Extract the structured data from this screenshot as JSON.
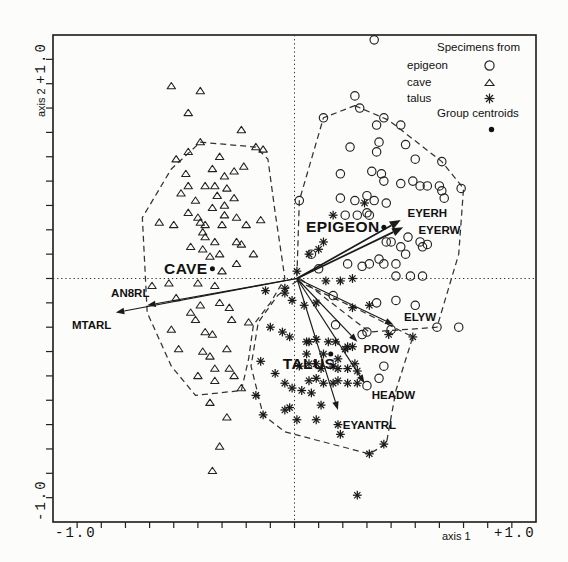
{
  "figure": {
    "width": 568,
    "height": 562
  },
  "axes": {
    "x_name": "axis 1",
    "x_min": "-1.0",
    "x_max": "+1.0",
    "y_name": "axis 2",
    "y_max": "+1.0",
    "y_min": "-1.0"
  },
  "legend": {
    "title": "Specimens from",
    "items": [
      {
        "label": "epigeon",
        "marker": "circle"
      },
      {
        "label": "cave",
        "marker": "triangle"
      },
      {
        "label": "talus",
        "marker": "asterisk"
      }
    ],
    "centroid_title": "Group centroids",
    "centroid_marker": "filled-dot"
  },
  "colors": {
    "ink": "#1a1a1a",
    "paper": "#fcfcfa",
    "hull": "#333333"
  },
  "chart_data": {
    "type": "scatter",
    "title": "",
    "xlabel": "axis 1",
    "ylabel": "axis 2",
    "xlim": [
      -1,
      1
    ],
    "ylim": [
      -1,
      1
    ],
    "grid": false,
    "legend_position": "top-right",
    "arrow_origin": [
      0.01,
      0.0
    ],
    "series": [
      {
        "name": "epigeon",
        "marker": "circle",
        "points": [
          [
            0.33,
            0.98
          ],
          [
            0.25,
            0.75
          ],
          [
            0.27,
            0.7
          ],
          [
            0.12,
            0.66
          ],
          [
            0.37,
            0.66
          ],
          [
            0.34,
            0.63
          ],
          [
            0.44,
            0.63
          ],
          [
            0.23,
            0.54
          ],
          [
            0.35,
            0.56
          ],
          [
            0.34,
            0.52
          ],
          [
            0.46,
            0.55
          ],
          [
            0.5,
            0.49
          ],
          [
            0.61,
            0.48
          ],
          [
            0.19,
            0.43
          ],
          [
            0.32,
            0.44
          ],
          [
            0.36,
            0.43
          ],
          [
            0.37,
            0.4
          ],
          [
            0.44,
            0.39
          ],
          [
            0.49,
            0.4
          ],
          [
            0.52,
            0.38
          ],
          [
            0.55,
            0.38
          ],
          [
            0.6,
            0.38
          ],
          [
            0.61,
            0.36
          ],
          [
            0.69,
            0.37
          ],
          [
            0.02,
            0.32
          ],
          [
            0.19,
            0.33
          ],
          [
            0.25,
            0.32
          ],
          [
            0.3,
            0.34
          ],
          [
            0.33,
            0.32
          ],
          [
            0.38,
            0.31
          ],
          [
            0.62,
            0.33
          ],
          [
            0.3,
            0.27
          ],
          [
            0.26,
            0.26
          ],
          [
            0.21,
            0.26
          ],
          [
            0.31,
            0.26
          ],
          [
            0.38,
            0.15
          ],
          [
            0.4,
            0.15
          ],
          [
            0.44,
            0.13
          ],
          [
            0.47,
            0.17
          ],
          [
            0.52,
            0.15
          ],
          [
            0.53,
            0.13
          ],
          [
            0.55,
            0.14
          ],
          [
            0.35,
            0.08
          ],
          [
            0.37,
            0.06
          ],
          [
            0.42,
            0.06
          ],
          [
            0.46,
            0.1
          ],
          [
            0.31,
            0.06
          ],
          [
            0.28,
            0.05
          ],
          [
            0.22,
            0.06
          ],
          [
            0.42,
            0.01
          ],
          [
            0.48,
            0.01
          ],
          [
            0.53,
            0.01
          ],
          [
            0.07,
            0.1
          ],
          [
            0.1,
            0.04
          ],
          [
            0.34,
            -0.1
          ],
          [
            0.42,
            -0.09
          ],
          [
            0.5,
            -0.11
          ],
          [
            0.17,
            -0.19
          ],
          [
            0.3,
            -0.22
          ],
          [
            0.4,
            -0.21
          ],
          [
            0.28,
            -0.23
          ],
          [
            0.59,
            -0.2
          ],
          [
            0.68,
            -0.2
          ],
          [
            0.37,
            -0.36
          ],
          [
            0.35,
            -0.41
          ],
          [
            0.3,
            -0.44
          ],
          [
            0.16,
            -0.07
          ]
        ]
      },
      {
        "name": "cave",
        "marker": "triangle",
        "points": [
          [
            -0.51,
            0.79
          ],
          [
            -0.39,
            0.77
          ],
          [
            -0.44,
            0.68
          ],
          [
            -0.22,
            0.61
          ],
          [
            -0.39,
            0.56
          ],
          [
            -0.16,
            0.54
          ],
          [
            -0.13,
            0.53
          ],
          [
            -0.49,
            0.49
          ],
          [
            -0.44,
            0.52
          ],
          [
            -0.31,
            0.5
          ],
          [
            -0.34,
            0.45
          ],
          [
            -0.21,
            0.46
          ],
          [
            -0.25,
            0.44
          ],
          [
            -0.45,
            0.43
          ],
          [
            -0.29,
            0.42
          ],
          [
            -0.37,
            0.38
          ],
          [
            -0.33,
            0.38
          ],
          [
            -0.44,
            0.38
          ],
          [
            -0.47,
            0.35
          ],
          [
            -0.28,
            0.37
          ],
          [
            -0.41,
            0.32
          ],
          [
            -0.32,
            0.34
          ],
          [
            -0.25,
            0.33
          ],
          [
            -0.34,
            0.29
          ],
          [
            -0.29,
            0.3
          ],
          [
            -0.44,
            0.27
          ],
          [
            -0.4,
            0.25
          ],
          [
            -0.29,
            0.26
          ],
          [
            -0.24,
            0.25
          ],
          [
            -0.56,
            0.23
          ],
          [
            -0.5,
            0.22
          ],
          [
            -0.39,
            0.23
          ],
          [
            -0.37,
            0.22
          ],
          [
            -0.3,
            0.22
          ],
          [
            -0.2,
            0.22
          ],
          [
            -0.14,
            0.24
          ],
          [
            -0.38,
            0.19
          ],
          [
            -0.37,
            0.17
          ],
          [
            -0.33,
            0.15
          ],
          [
            -0.24,
            0.15
          ],
          [
            -0.22,
            0.14
          ],
          [
            -0.43,
            0.13
          ],
          [
            -0.38,
            0.12
          ],
          [
            -0.35,
            0.09
          ],
          [
            -0.31,
            0.1
          ],
          [
            -0.17,
            0.1
          ],
          [
            -0.24,
            0.06
          ],
          [
            -0.3,
            0.03
          ],
          [
            -0.52,
            -0.02
          ],
          [
            -0.4,
            -0.02
          ],
          [
            -0.33,
            -0.03
          ],
          [
            -0.59,
            -0.03
          ],
          [
            -0.49,
            -0.08
          ],
          [
            -0.39,
            -0.11
          ],
          [
            -0.31,
            -0.1
          ],
          [
            -0.27,
            -0.12
          ],
          [
            -0.43,
            -0.14
          ],
          [
            -0.41,
            -0.17
          ],
          [
            -0.26,
            -0.17
          ],
          [
            -0.19,
            -0.18
          ],
          [
            -0.51,
            -0.21
          ],
          [
            -0.37,
            -0.22
          ],
          [
            -0.34,
            -0.23
          ],
          [
            -0.28,
            -0.29
          ],
          [
            -0.48,
            -0.29
          ],
          [
            -0.38,
            -0.3
          ],
          [
            -0.35,
            -0.32
          ],
          [
            -0.33,
            -0.37
          ],
          [
            -0.27,
            -0.37
          ],
          [
            -0.4,
            -0.4
          ],
          [
            -0.33,
            -0.42
          ],
          [
            -0.25,
            -0.4
          ],
          [
            -0.22,
            -0.45
          ],
          [
            -0.35,
            -0.51
          ],
          [
            -0.28,
            -0.57
          ],
          [
            -0.31,
            -0.69
          ],
          [
            -0.34,
            -0.79
          ]
        ]
      },
      {
        "name": "talus",
        "marker": "asterisk",
        "points": [
          [
            -0.04,
            -0.06
          ],
          [
            -0.01,
            -0.09
          ],
          [
            0.04,
            -0.11
          ],
          [
            0.09,
            -0.1
          ],
          [
            0.24,
            -0.12
          ],
          [
            0.31,
            -0.11
          ],
          [
            0.09,
            -0.25
          ],
          [
            0.17,
            -0.26
          ],
          [
            0.14,
            -0.26
          ],
          [
            0.22,
            -0.28
          ],
          [
            0.05,
            -0.26
          ],
          [
            0.39,
            -0.23
          ],
          [
            0.49,
            -0.24
          ],
          [
            -0.05,
            -0.22
          ],
          [
            0.06,
            -0.26
          ],
          [
            0.05,
            -0.31
          ],
          [
            0.12,
            -0.31
          ],
          [
            0.21,
            -0.29
          ],
          [
            0.24,
            -0.28
          ],
          [
            0.18,
            -0.33
          ],
          [
            0.25,
            -0.35
          ],
          [
            0.06,
            -0.35
          ],
          [
            0.09,
            -0.35
          ],
          [
            0.02,
            -0.36
          ],
          [
            0.11,
            -0.37
          ],
          [
            0.16,
            -0.36
          ],
          [
            0.18,
            -0.37
          ],
          [
            0.22,
            -0.37
          ],
          [
            0.26,
            -0.38
          ],
          [
            0.06,
            -0.42
          ],
          [
            0.09,
            -0.41
          ],
          [
            0.12,
            -0.43
          ],
          [
            0.16,
            -0.43
          ],
          [
            0.18,
            -0.42
          ],
          [
            0.22,
            -0.43
          ],
          [
            0.26,
            -0.43
          ],
          [
            -0.01,
            -0.45
          ],
          [
            -0.04,
            -0.43
          ],
          [
            0.03,
            -0.46
          ],
          [
            0.07,
            -0.47
          ],
          [
            0.11,
            -0.52
          ],
          [
            0.18,
            -0.6
          ],
          [
            0.09,
            -0.58
          ],
          [
            0.01,
            -0.58
          ],
          [
            -0.02,
            -0.53
          ],
          [
            -0.04,
            -0.54
          ],
          [
            0.19,
            -0.64
          ],
          [
            0.37,
            -0.68
          ],
          [
            0.31,
            -0.72
          ],
          [
            0.26,
            -0.89
          ],
          [
            0.29,
            0.31
          ],
          [
            0.16,
            0.26
          ],
          [
            0.12,
            0.15
          ],
          [
            0.1,
            0.12
          ],
          [
            0.06,
            0.1
          ],
          [
            0.01,
            0.03
          ],
          [
            0.13,
            -0.01
          ],
          [
            0.19,
            -0.01
          ],
          [
            0.24,
            0.0
          ],
          [
            -0.12,
            -0.05
          ],
          [
            -0.04,
            -0.04
          ],
          [
            -0.1,
            -0.2
          ],
          [
            -0.14,
            -0.34
          ],
          [
            -0.08,
            -0.39
          ],
          [
            -0.16,
            -0.48
          ],
          [
            -0.13,
            -0.56
          ],
          [
            -0.02,
            -0.24
          ]
        ]
      }
    ],
    "hulls": [
      {
        "group": "cave",
        "points": [
          [
            -0.39,
            0.56
          ],
          [
            -0.16,
            0.54
          ],
          [
            -0.11,
            0.49
          ],
          [
            -0.08,
            0.27
          ],
          [
            -0.05,
            0.07
          ],
          [
            -0.04,
            0.0
          ],
          [
            -0.1,
            -0.1
          ],
          [
            -0.17,
            -0.19
          ],
          [
            -0.19,
            -0.33
          ],
          [
            -0.22,
            -0.46
          ],
          [
            -0.41,
            -0.48
          ],
          [
            -0.51,
            -0.36
          ],
          [
            -0.61,
            -0.14
          ],
          [
            -0.63,
            0.25
          ],
          [
            -0.51,
            0.45
          ]
        ]
      },
      {
        "group": "epigeon",
        "points": [
          [
            0.25,
            0.71
          ],
          [
            0.39,
            0.65
          ],
          [
            0.61,
            0.48
          ],
          [
            0.7,
            0.37
          ],
          [
            0.68,
            0.1
          ],
          [
            0.59,
            -0.2
          ],
          [
            0.31,
            -0.22
          ],
          [
            0.01,
            0.01
          ],
          [
            0.02,
            0.32
          ],
          [
            0.12,
            0.66
          ]
        ]
      },
      {
        "group": "talus",
        "points": [
          [
            0.01,
            -0.01
          ],
          [
            0.27,
            -0.13
          ],
          [
            0.49,
            -0.24
          ],
          [
            0.42,
            -0.46
          ],
          [
            0.38,
            -0.68
          ],
          [
            0.31,
            -0.72
          ],
          [
            -0.04,
            -0.63
          ],
          [
            -0.13,
            -0.56
          ],
          [
            -0.18,
            -0.36
          ],
          [
            -0.15,
            -0.18
          ],
          [
            -0.07,
            -0.07
          ]
        ]
      }
    ],
    "centroids": [
      {
        "group": "EPIGEON",
        "x": 0.37,
        "y": 0.21
      },
      {
        "group": "CAVE",
        "x": -0.34,
        "y": 0.04
      },
      {
        "group": "TALUS",
        "x": 0.15,
        "y": -0.31
      }
    ],
    "group_labels": [
      {
        "text": "CAVE",
        "x": -0.45,
        "y": 0.04
      },
      {
        "text": "EPIGEON",
        "x": 0.2,
        "y": 0.21
      },
      {
        "text": "TALUS",
        "x": 0.06,
        "y": -0.35
      }
    ],
    "arrows": [
      {
        "label": "EYERH",
        "x": 0.44,
        "y": 0.24,
        "label_x": 0.55,
        "label_y": 0.27,
        "bold": true
      },
      {
        "label": "EYERW",
        "x": 0.45,
        "y": 0.21,
        "label_x": 0.6,
        "label_y": 0.2,
        "bold": true
      },
      {
        "label": "ELYW",
        "x": 0.41,
        "y": -0.19,
        "label_x": 0.52,
        "label_y": -0.16,
        "bold": false
      },
      {
        "label": "PROW",
        "x": 0.26,
        "y": -0.26,
        "label_x": 0.36,
        "label_y": -0.29,
        "bold": false
      },
      {
        "label": "HEADW",
        "x": 0.29,
        "y": -0.43,
        "label_x": 0.41,
        "label_y": -0.48,
        "bold": false
      },
      {
        "label": "EYANTRL",
        "x": 0.18,
        "y": -0.54,
        "label_x": 0.31,
        "label_y": -0.6,
        "bold": false
      },
      {
        "label": "AN8RL",
        "x": -0.61,
        "y": -0.11,
        "label_x": -0.68,
        "label_y": -0.06,
        "bold": false
      },
      {
        "label": "MTARL",
        "x": -0.74,
        "y": -0.14,
        "label_x": -0.84,
        "label_y": -0.19,
        "bold": false
      }
    ]
  }
}
